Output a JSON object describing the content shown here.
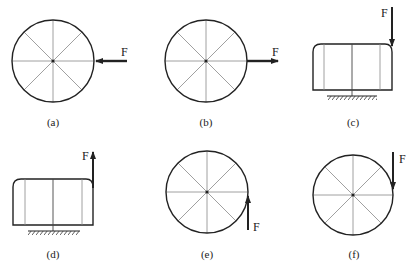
{
  "figure": {
    "panels": [
      {
        "id": "a",
        "caption": "(a)",
        "shape": "wheel",
        "force_label": "F",
        "force_direction": "left, pushing on right rim at center height"
      },
      {
        "id": "b",
        "caption": "(b)",
        "shape": "wheel",
        "force_label": "F",
        "force_direction": "right, pulling from right rim at center height"
      },
      {
        "id": "c",
        "caption": "(c)",
        "shape": "block on support",
        "force_label": "F",
        "force_direction": "down, at top-right corner"
      },
      {
        "id": "d",
        "caption": "(d)",
        "shape": "block on support",
        "force_label": "F",
        "force_direction": "up, at top-right corner"
      },
      {
        "id": "e",
        "caption": "(e)",
        "shape": "wheel",
        "force_label": "F",
        "force_direction": "up, tangent at right rim below center"
      },
      {
        "id": "f",
        "caption": "(f)",
        "shape": "wheel",
        "force_label": "F",
        "force_direction": "down, tangent at right rim above center"
      }
    ],
    "colors": {
      "stroke": "#222222",
      "spoke": "#888888",
      "background": "#ffffff"
    }
  }
}
